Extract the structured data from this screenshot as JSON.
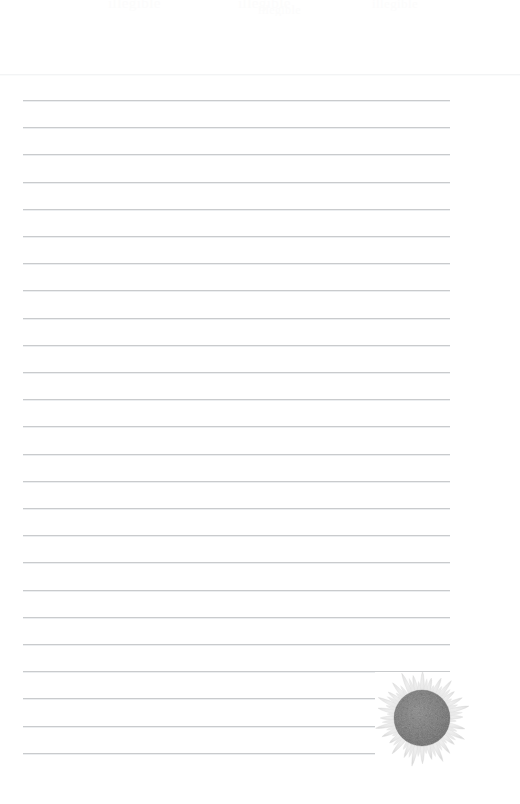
{
  "page": {
    "width": 520,
    "height": 804,
    "background_color": "#ffffff",
    "type": "blank-ruled-stationery"
  },
  "header": {
    "ghost_text_visible": "barely-legible cut-off text",
    "ghost_fragments": [
      "illegible",
      "illegible",
      "illegible",
      "illegible"
    ],
    "divider_color": "#f3f4f5",
    "divider_y": 74
  },
  "ruled_lines": {
    "count": 25,
    "first_y": 100,
    "spacing": 27.2,
    "left_x": 23,
    "right_x": 450,
    "color": "#c9cbcd",
    "echo_color": "#eceef0",
    "thickness": 1,
    "content": ""
  },
  "decoration": {
    "name": "sunflower",
    "description": "grayscale sunflower illustration in lower right corner",
    "x": 378,
    "y": 678,
    "width": 90,
    "height": 90,
    "petal_color": "#e6e6e6",
    "petal_edge_color": "#d2d2d2",
    "disc_color": "#7c7c7c",
    "disc_inner_color": "#6e6e6e",
    "disc_radius": 28,
    "petal_count": 28
  }
}
